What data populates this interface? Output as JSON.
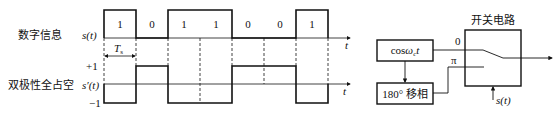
{
  "labels": {
    "digital_info": "数字信息",
    "bipolar_nrz": "双极性全占空",
    "s_t": "s(t)",
    "s_prime_t": "s′(t)",
    "t_axis": "t",
    "Ts": "Ts",
    "plus_one": "+1",
    "minus_one": "−1"
  },
  "bits": [
    "1",
    "0",
    "1",
    "1",
    "0",
    "0",
    "1"
  ],
  "block_diagram": {
    "switch_title": "开关电路",
    "carrier_block": "cosωct",
    "phase_shift_block": "180° 移相",
    "input_0": "0",
    "input_pi": "π",
    "control": "s(t)"
  }
}
